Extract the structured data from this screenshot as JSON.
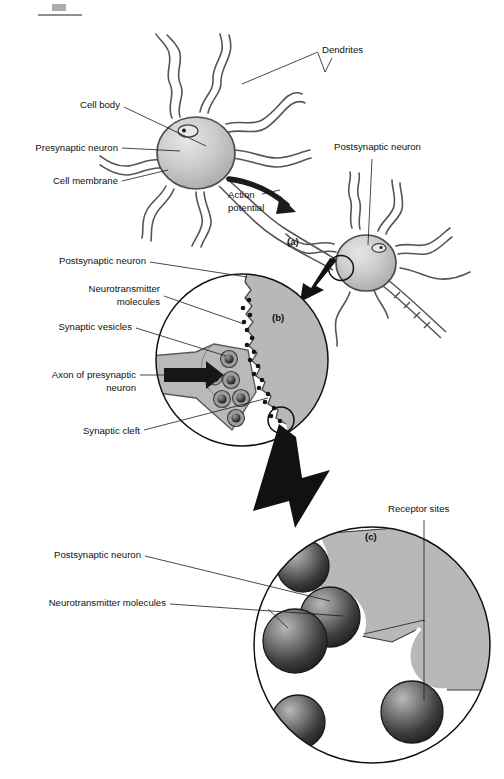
{
  "figure": {
    "panels": [
      {
        "id": "a",
        "label": "(a)",
        "caption": "Two neurons and an action potential travelling along the axon"
      },
      {
        "id": "b",
        "label": "(b)",
        "caption": "Magnified view of the synapse"
      },
      {
        "id": "c",
        "label": "(c)",
        "caption": "Magnified view of receptor sites on the postsynaptic membrane"
      }
    ]
  },
  "panel_a": {
    "panel_label": "(a)",
    "labels": {
      "dendrites": "Dendrites",
      "cell_body": "Cell body",
      "presynaptic_neuron": "Presynaptic neuron",
      "cell_membrane": "Cell membrane",
      "postsynaptic_neuron": "Postsynaptic neuron",
      "action_potential_line1": "Action",
      "action_potential_line2": "potential"
    }
  },
  "panel_b": {
    "panel_label": "(b)",
    "labels": {
      "postsynaptic_neuron": "Postsynaptic neuron",
      "neurotransmitter_line1": "Neurotransmitter",
      "neurotransmitter_line2": "molecules",
      "synaptic_vesicles": "Synaptic vesicles",
      "axon_line1": "Axon of presynaptic",
      "axon_line2": "neuron",
      "synaptic_cleft": "Synaptic cleft"
    },
    "vesicle_count": 6,
    "neurotransmitter_dot_count": 18
  },
  "panel_c": {
    "panel_label": "(c)",
    "labels": {
      "receptor_sites": "Receptor sites",
      "postsynaptic_neuron": "Postsynaptic neuron",
      "neurotransmitter_molecules": "Neurotransmitter molecules"
    },
    "molecule_count": 5,
    "receptor_site_count": 3
  },
  "colors": {
    "outline": "#3a3a3a",
    "cell_fill": "#c9c9c9",
    "membrane_fill": "#b8b8b8",
    "molecule_dark": "#2b2b2b",
    "molecule_mid": "#6d6d6d",
    "arrow_black": "#111111",
    "text": "#111111",
    "page_background": "#ffffff"
  }
}
